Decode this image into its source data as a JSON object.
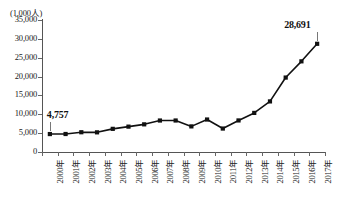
{
  "chart_data": {
    "type": "line",
    "title": "",
    "subtitle": "",
    "xlabel": "",
    "ylabel": "(1,000人)",
    "unit_caption": "(1,000人)",
    "grid": false,
    "legend": "none",
    "marker": "square",
    "line_color": "#111111",
    "categories": [
      "2000年",
      "2001年",
      "2002年",
      "2003年",
      "2004年",
      "2005年",
      "2006年",
      "2007年",
      "2008年",
      "2009年",
      "2010年",
      "2011年",
      "2012年",
      "2013年",
      "2014年",
      "2015年",
      "2016年",
      "2017年"
    ],
    "values": [
      4757,
      4772,
      5239,
      5212,
      6138,
      6728,
      7334,
      8347,
      8351,
      6790,
      8611,
      6219,
      8368,
      10364,
      13413,
      19737,
      24039,
      28691
    ],
    "ylim": [
      0,
      35000
    ],
    "ytick_values": [
      35000,
      30000,
      25000,
      20000,
      15000,
      10000,
      5000,
      0
    ],
    "ytick_labels": [
      "35,000",
      "30,000",
      "25,000",
      "20,000",
      "15,000",
      "10,000",
      "5,000",
      "0"
    ],
    "annotations": [
      {
        "name": "first-value-label",
        "text": "4,757",
        "category": "2000年",
        "value": 4757
      },
      {
        "name": "last-value-label",
        "text": "28,691",
        "category": "2017年",
        "value": 28691
      }
    ]
  }
}
